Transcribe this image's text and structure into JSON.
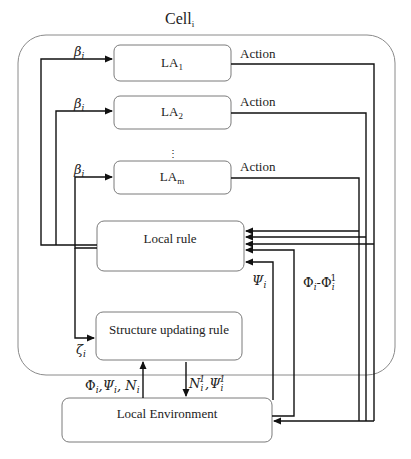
{
  "diagram": {
    "title": {
      "main": "Cell",
      "sub": "i"
    },
    "colors": {
      "wire": "#111111",
      "box_border": "#7a7a7a",
      "cell_border": "#8a8a8a",
      "background": "#ffffff"
    },
    "boxes": {
      "la1": {
        "label": "LA",
        "sub": "1"
      },
      "la2": {
        "label": "LA",
        "sub": "2"
      },
      "ellipsis": "⋮",
      "lam": {
        "label": "LA",
        "sub": "m"
      },
      "local_rule": {
        "label": "Local rule"
      },
      "structure_rule": {
        "label": "Structure updating rule"
      },
      "local_env": {
        "label": "Local Environment"
      }
    },
    "edge_labels": {
      "beta_1": {
        "sym": "β",
        "sub": "i"
      },
      "beta_2": {
        "sym": "β",
        "sub": "i"
      },
      "beta_m": {
        "sym": "β",
        "sub": "i"
      },
      "zeta": {
        "sym": "ζ",
        "sub": "i"
      },
      "action_1": "Action",
      "action_2": "Action",
      "action_m": "Action",
      "psi": {
        "sym": "Ψ",
        "sub": "i"
      },
      "phi_diff": {
        "a": "Φ",
        "a_sub": "i",
        "dash": "-",
        "b": "Φ",
        "b_sub": "i",
        "b_sup": "1"
      },
      "env_up": {
        "phi": "Φ",
        "phi_sub": "i",
        "psi": ",Ψ",
        "psi_sub": "i",
        "n": ", N",
        "n_sub": "i"
      },
      "env_down": {
        "n": "N",
        "n_sub": "i",
        "n_sup": "1",
        "psi": ",Ψ",
        "psi_sub": "i",
        "psi_sup": "1"
      }
    }
  }
}
